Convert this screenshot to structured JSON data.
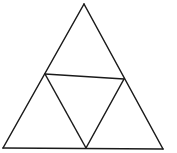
{
  "diagram": {
    "type": "subdivided-triangle",
    "stroke_color": "#1a1a1a",
    "background_color": "#ffffff",
    "stroke_width": 1.5,
    "vertices": {
      "apex": [
        84,
        4
      ],
      "bottom_left": [
        3,
        148
      ],
      "bottom_right": [
        163,
        149
      ],
      "left_mid": [
        45,
        74
      ],
      "right_mid": [
        124,
        79
      ],
      "bottom_mid": [
        86,
        148
      ]
    },
    "segments": [
      {
        "name": "outer-left-edge",
        "from": "apex",
        "to": "bottom_left"
      },
      {
        "name": "outer-right-edge",
        "from": "apex",
        "to": "bottom_right"
      },
      {
        "name": "outer-bottom-edge",
        "from": "bottom_left",
        "to": "bottom_right"
      },
      {
        "name": "inner-top-edge",
        "from": "left_mid",
        "to": "right_mid"
      },
      {
        "name": "inner-left-edge",
        "from": "left_mid",
        "to": "bottom_mid"
      },
      {
        "name": "inner-right-edge",
        "from": "right_mid",
        "to": "bottom_mid"
      }
    ]
  }
}
